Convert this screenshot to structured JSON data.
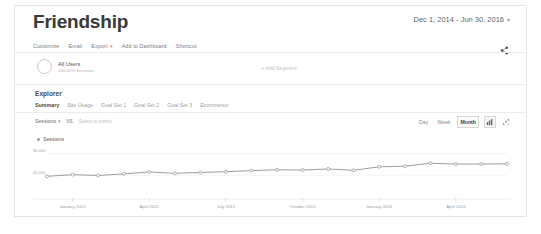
{
  "header": {
    "title": "Friendship",
    "date_range": "Dec 1, 2014 - Jun 30, 2016",
    "date_caret": "▾"
  },
  "toolbar": {
    "items": [
      {
        "label": "Customize",
        "caret": ""
      },
      {
        "label": "Email",
        "caret": ""
      },
      {
        "label": "Export",
        "caret": "▾"
      },
      {
        "label": "Add to Dashboard",
        "caret": ""
      },
      {
        "label": "Shortcut",
        "caret": ""
      }
    ],
    "share_icon": "share-icon"
  },
  "segment": {
    "name": "All Users",
    "sub": "100.00% Sessions",
    "add_segment": "+ Add Segment"
  },
  "explorer": {
    "label": "Explorer",
    "tabs": [
      {
        "label": "Summary",
        "active": true
      },
      {
        "label": "Site Usage",
        "active": false
      },
      {
        "label": "Goal Set 1",
        "active": false
      },
      {
        "label": "Goal Set 2",
        "active": false
      },
      {
        "label": "Goal Set 3",
        "active": false
      },
      {
        "label": "Ecommerce",
        "active": false
      }
    ]
  },
  "metric_row": {
    "primary_metric": "Sessions",
    "primary_caret": "▾",
    "vs_label": "VS.",
    "secondary_placeholder": "Select a metric",
    "granularity": [
      {
        "label": "Day",
        "selected": false
      },
      {
        "label": "Week",
        "selected": false
      },
      {
        "label": "Month",
        "selected": true
      }
    ],
    "icons": [
      {
        "name": "bar-chart-icon",
        "selected": true
      },
      {
        "name": "scatter-plot-icon",
        "selected": false
      }
    ]
  },
  "chart_data": {
    "type": "line",
    "title": "Sessions",
    "xlabel": "",
    "ylabel": "",
    "ylim": [
      0,
      90000
    ],
    "yticks": [
      80000,
      40000
    ],
    "ytick_labels": [
      "80,000",
      "40,000"
    ],
    "grid": true,
    "legend": "Sessions",
    "legend_position": "top-left",
    "x_tick_labels": [
      "January 2015",
      "April 2015",
      "July 2015",
      "October 2015",
      "January 2016",
      "April 2016"
    ],
    "x": [
      "Dec 2014",
      "Jan 2015",
      "Feb 2015",
      "Mar 2015",
      "Apr 2015",
      "May 2015",
      "Jun 2015",
      "Jul 2015",
      "Aug 2015",
      "Sep 2015",
      "Oct 2015",
      "Nov 2015",
      "Dec 2015",
      "Jan 2016",
      "Feb 2016",
      "Mar 2016",
      "Apr 2016",
      "May 2016",
      "Jun 2016"
    ],
    "values": [
      38000,
      41000,
      39500,
      42500,
      46000,
      43500,
      45000,
      46500,
      48500,
      50000,
      49500,
      51500,
      49000,
      55500,
      56500,
      62000,
      60500,
      60500,
      61000
    ],
    "series": [
      {
        "name": "Sessions",
        "color": "#9e9e9e",
        "values": [
          38000,
          41000,
          39500,
          42500,
          46000,
          43500,
          45000,
          46500,
          48500,
          50000,
          49500,
          51500,
          49000,
          55500,
          56500,
          62000,
          60500,
          60500,
          61000
        ]
      }
    ]
  }
}
